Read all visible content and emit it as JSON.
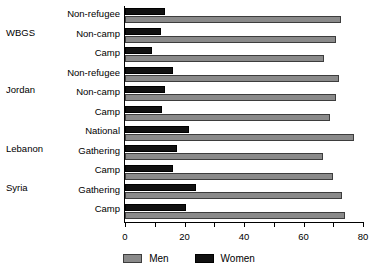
{
  "chart_data": {
    "type": "bar",
    "orientation": "horizontal",
    "title": "",
    "xlabel": "",
    "ylabel": "",
    "xlim": [
      0,
      80
    ],
    "xticks": [
      0,
      20,
      40,
      60,
      80
    ],
    "xtick_labels": [
      "0",
      "20",
      "40",
      "60",
      "80"
    ],
    "minor_tick_step": 10,
    "grid": false,
    "legend_position": "bottom-center",
    "legend": [
      "Men",
      "Women"
    ],
    "colors": {
      "men": "#8a8a8a",
      "women": "#111111",
      "axis": "#000000",
      "background": "#ffffff"
    },
    "groups": [
      {
        "name": "WBGS",
        "categories": [
          "Non-refugee",
          "Non-camp",
          "Camp"
        ],
        "series": [
          {
            "name": "Men",
            "values": [
              72.5,
              71.0,
              67.0
            ]
          },
          {
            "name": "Women",
            "values": [
              13.5,
              12.0,
              9.0
            ]
          }
        ]
      },
      {
        "name": "Jordan",
        "categories": [
          "Non-refugee",
          "Non-camp",
          "Camp"
        ],
        "series": [
          {
            "name": "Men",
            "values": [
              72.0,
              71.0,
              69.0
            ]
          },
          {
            "name": "Women",
            "values": [
              16.0,
              13.5,
              12.5
            ]
          }
        ]
      },
      {
        "name": "Lebanon",
        "categories": [
          "National",
          "Gathering",
          "Camp"
        ],
        "series": [
          {
            "name": "Men",
            "values": [
              77.0,
              66.5,
              70.0
            ]
          },
          {
            "name": "Women",
            "values": [
              21.5,
              17.5,
              16.0
            ]
          }
        ]
      },
      {
        "name": "Syria",
        "categories": [
          "Gathering",
          "Camp"
        ],
        "series": [
          {
            "name": "Men",
            "values": [
              73.0,
              74.0
            ]
          },
          {
            "name": "Women",
            "values": [
              24.0,
              20.5
            ]
          }
        ]
      }
    ],
    "rows_flat": [
      {
        "group": "WBGS",
        "category": "Non-refugee",
        "men": 72.5,
        "women": 13.5
      },
      {
        "group": "WBGS",
        "category": "Non-camp",
        "men": 71.0,
        "women": 12.0
      },
      {
        "group": "WBGS",
        "category": "Camp",
        "men": 67.0,
        "women": 9.0
      },
      {
        "group": "Jordan",
        "category": "Non-refugee",
        "men": 72.0,
        "women": 16.0
      },
      {
        "group": "Jordan",
        "category": "Non-camp",
        "men": 71.0,
        "women": 13.5
      },
      {
        "group": "Jordan",
        "category": "Camp",
        "men": 69.0,
        "women": 12.5
      },
      {
        "group": "Lebanon",
        "category": "National",
        "men": 77.0,
        "women": 21.5
      },
      {
        "group": "Lebanon",
        "category": "Gathering",
        "men": 66.5,
        "women": 17.5
      },
      {
        "group": "Lebanon",
        "category": "Camp",
        "men": 70.0,
        "women": 16.0
      },
      {
        "group": "Syria",
        "category": "Gathering",
        "men": 73.0,
        "women": 24.0
      },
      {
        "group": "Syria",
        "category": "Camp",
        "men": 74.0,
        "women": 20.5
      }
    ],
    "group_labels": [
      "WBGS",
      "Jordan",
      "Lebanon",
      "Syria"
    ],
    "category_labels": [
      "Non-refugee",
      "Non-camp",
      "Camp",
      "Non-refugee",
      "Non-camp",
      "Camp",
      "National",
      "Gathering",
      "Camp",
      "Gathering",
      "Camp"
    ]
  },
  "legend": {
    "men_label": "Men",
    "women_label": "Women"
  }
}
